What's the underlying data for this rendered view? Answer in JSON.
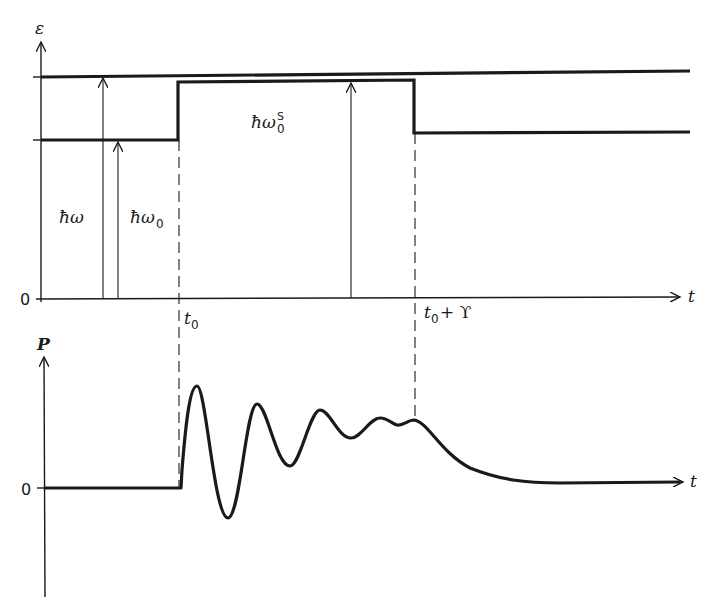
{
  "top_panel": {
    "y_axis_label": "ε",
    "x_axis_label": "t",
    "zero_label": "0",
    "arrows": [
      {
        "label": "ħω",
        "description": "photon energy arrow from ground to upper level"
      },
      {
        "label": "ħω₀",
        "description": "unperturbed transition energy"
      },
      {
        "label": "ħω₀ˢ",
        "description": "shifted transition energy during pulse"
      }
    ],
    "label_hw": "ħω",
    "label_hw0": "ħω",
    "label_hw0_sub": "0",
    "label_hw0s": "ħω",
    "label_hw0s_sub": "0",
    "label_hw0s_sup": "S",
    "t0_label": "t",
    "t0_sub": "0",
    "t0_upsilon_label_prefix": "t",
    "t0_upsilon_sub": "0",
    "t0_upsilon_suffix": " + ϒ"
  },
  "bottom_panel": {
    "y_axis_label": "P",
    "x_axis_label": "t",
    "zero_label": "0"
  },
  "colors": {
    "ink": "#1a1a1a",
    "background": "#ffffff"
  }
}
